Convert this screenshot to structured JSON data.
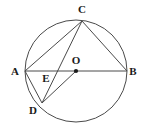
{
  "figure": {
    "type": "euclidean-geometry",
    "canvas": {
      "width": 143,
      "height": 127
    },
    "stroke_color": "#4a4a4a",
    "label_color": "#1a1a1a",
    "background_color": "#ffffff"
  },
  "circle": {
    "name": "circle-O",
    "center": {
      "x": 76,
      "y": 71
    },
    "radius": 51
  },
  "points": {
    "A": {
      "label": "A",
      "x": 25,
      "y": 71,
      "label_x": 15,
      "label_y": 71,
      "on_circle": true
    },
    "B": {
      "label": "B",
      "x": 127,
      "y": 71,
      "label_x": 133,
      "label_y": 71,
      "on_circle": true
    },
    "C": {
      "label": "C",
      "x": 82,
      "y": 21,
      "label_x": 82,
      "label_y": 9,
      "on_circle": true
    },
    "D": {
      "label": "D",
      "x": 42,
      "y": 103,
      "label_x": 33,
      "label_y": 110,
      "on_circle": true
    },
    "E": {
      "label": "E",
      "x": 53,
      "y": 71,
      "label_x": 46,
      "label_y": 78,
      "on_circle": false
    },
    "O": {
      "label": "O",
      "x": 76,
      "y": 71,
      "label_x": 76,
      "label_y": 60,
      "on_circle": false
    }
  },
  "segments": [
    {
      "name": "diameter-AB",
      "from": "A",
      "to": "B"
    },
    {
      "name": "chord-CA",
      "from": "C",
      "to": "A"
    },
    {
      "name": "chord-CB",
      "from": "C",
      "to": "B"
    },
    {
      "name": "chord-CD",
      "from": "C",
      "to": "D"
    },
    {
      "name": "chord-AD",
      "from": "A",
      "to": "D"
    },
    {
      "name": "radius-DO",
      "from": "D",
      "to": "O"
    }
  ],
  "markers": [
    {
      "name": "center-dot-O",
      "at": "O",
      "radius": 2.1
    }
  ],
  "labels_order": [
    "C",
    "A",
    "O",
    "B",
    "E",
    "D"
  ]
}
